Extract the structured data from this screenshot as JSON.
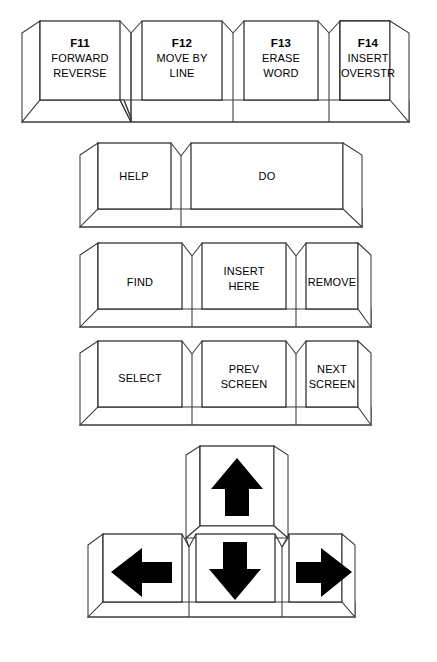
{
  "diagram": {
    "line_color": "#1a1a1a",
    "side_color": "#3a3a3a",
    "fill_color": "#ffffff",
    "background": "#ffffff",
    "arrow_color": "#000000"
  },
  "rows": [
    {
      "name": "function-key-row",
      "keys": [
        {
          "id": "f11",
          "lines": [
            "F11",
            "FORWARD",
            "REVERSE"
          ],
          "bold_first": true
        },
        {
          "id": "f12",
          "lines": [
            "F12",
            "MOVE BY",
            "LINE"
          ],
          "bold_first": true
        },
        {
          "id": "f13",
          "lines": [
            "F13",
            "ERASE",
            "WORD"
          ],
          "bold_first": true
        },
        {
          "id": "f14",
          "lines": [
            "F14",
            "INSERT",
            "OVERSTR"
          ],
          "bold_first": true
        }
      ]
    },
    {
      "name": "help-do-row",
      "keys": [
        {
          "id": "help",
          "lines": [
            "HELP"
          ],
          "bold_first": false
        },
        {
          "id": "do",
          "lines": [
            "DO"
          ],
          "bold_first": false
        }
      ]
    },
    {
      "name": "find-insert-remove-row",
      "keys": [
        {
          "id": "find",
          "lines": [
            "FIND"
          ],
          "bold_first": false
        },
        {
          "id": "insert-here",
          "lines": [
            "INSERT",
            "HERE"
          ],
          "bold_first": false
        },
        {
          "id": "remove",
          "lines": [
            "REMOVE"
          ],
          "bold_first": false
        }
      ]
    },
    {
      "name": "select-screen-row",
      "keys": [
        {
          "id": "select",
          "lines": [
            "SELECT"
          ],
          "bold_first": false
        },
        {
          "id": "prev-screen",
          "lines": [
            "PREV",
            "SCREEN"
          ],
          "bold_first": false
        },
        {
          "id": "next-screen",
          "lines": [
            "NEXT",
            "SCREEN"
          ],
          "bold_first": false
        }
      ]
    },
    {
      "name": "arrow-key-cluster",
      "keys": [
        {
          "id": "arrow-up",
          "lines": [],
          "glyph": "arrow-up"
        },
        {
          "id": "arrow-left",
          "lines": [],
          "glyph": "arrow-left"
        },
        {
          "id": "arrow-down",
          "lines": [],
          "glyph": "arrow-down"
        },
        {
          "id": "arrow-right",
          "lines": [],
          "glyph": "arrow-right"
        }
      ]
    }
  ],
  "labels": {
    "f11_line1": "F11",
    "f11_line2": "FORWARD",
    "f11_line3": "REVERSE",
    "f12_line1": "F12",
    "f12_line2": "MOVE BY",
    "f12_line3": "LINE",
    "f13_line1": "F13",
    "f13_line2": "ERASE",
    "f13_line3": "WORD",
    "f14_line1": "F14",
    "f14_line2": "INSERT",
    "f14_line3": "OVERSTR",
    "help": "HELP",
    "do": "DO",
    "find": "FIND",
    "insert_line1": "INSERT",
    "insert_line2": "HERE",
    "remove": "REMOVE",
    "select": "SELECT",
    "prev_line1": "PREV",
    "prev_line2": "SCREEN",
    "next_line1": "NEXT",
    "next_line2": "SCREEN"
  },
  "icons": {
    "arrow_up": "arrow-up-icon",
    "arrow_down": "arrow-down-icon",
    "arrow_left": "arrow-left-icon",
    "arrow_right": "arrow-right-icon"
  }
}
